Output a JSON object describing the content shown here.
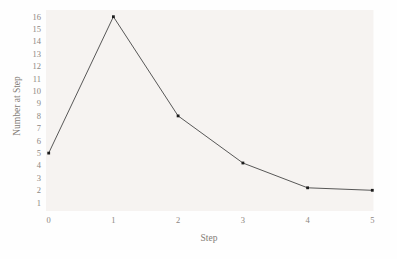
{
  "chart_data": {
    "type": "line",
    "title": "",
    "xlabel": "Step",
    "ylabel": "Number at Step",
    "x": [
      0,
      1,
      2,
      3,
      4,
      5
    ],
    "series": [
      {
        "name": "number-at-step",
        "values": [
          5,
          16,
          8,
          4.2,
          2.2,
          2
        ]
      }
    ],
    "x_ticks": [
      0,
      1,
      2,
      3,
      4,
      5
    ],
    "y_ticks": [
      1,
      2,
      3,
      4,
      5,
      6,
      7,
      8,
      9,
      10,
      11,
      12,
      13,
      14,
      15,
      16
    ],
    "xlim": [
      0,
      5
    ],
    "ylim": [
      0.3,
      16.5
    ],
    "grid": false,
    "legend": "none",
    "marker": "square",
    "colors": {
      "line": "#454545",
      "marker": "#1c1c1c",
      "plot_background": "#f6f3f1",
      "page_background": "#fefefe",
      "label_text": "#8d8781"
    }
  }
}
